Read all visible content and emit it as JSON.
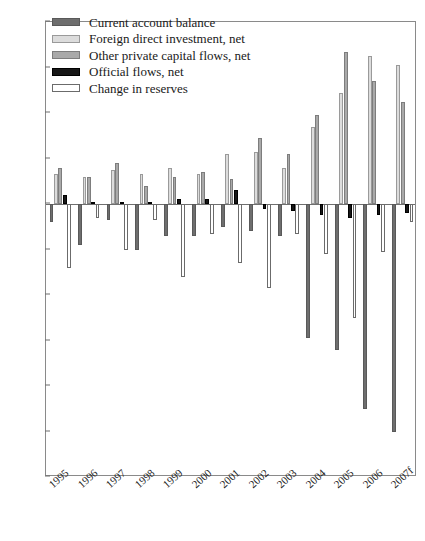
{
  "chart_data": {
    "type": "bar",
    "title": "",
    "subtitle": "",
    "xlabel": "",
    "ylabel": "",
    "ylim": [
      -120,
      80
    ],
    "ytick_step": 20,
    "yticks": [
      80,
      60,
      40,
      20,
      0,
      -20,
      -40,
      -60,
      -80,
      -100,
      -120
    ],
    "grid": false,
    "legend_position": "top-left",
    "categories": [
      "1995",
      "1996",
      "1997",
      "1998",
      "1999",
      "2000",
      "2001",
      "2002",
      "2003",
      "2004",
      "2005",
      "2006",
      "2007f"
    ],
    "series": [
      {
        "name": "Current account balance",
        "color": "#6e6e6e",
        "values": [
          -8,
          -18,
          -7,
          -20,
          -14,
          -14,
          -10,
          -12,
          -14,
          -59,
          -64,
          -90,
          -100
        ]
      },
      {
        "name": "Foreign direct investment, net",
        "color": "#dcdcdc",
        "values": [
          13,
          12,
          15,
          13,
          16,
          13,
          22,
          23,
          16,
          34,
          49,
          65,
          61
        ]
      },
      {
        "name": "Other private capital flows, net",
        "color": "#a9a9a9",
        "values": [
          16,
          12,
          18,
          8,
          12,
          14,
          11,
          29,
          22,
          39,
          67,
          54,
          45
        ]
      },
      {
        "name": "Official flows, net",
        "color": "#171717",
        "values": [
          4,
          1,
          1,
          1,
          2,
          2,
          6,
          -2,
          -3,
          -5,
          -6,
          -5,
          -4
        ]
      },
      {
        "name": "Change in reserves",
        "color": "#ffffff",
        "values": [
          -28,
          -6,
          -20,
          -7,
          -32,
          -13,
          -26,
          -37,
          -13,
          -22,
          -50,
          -21,
          -8
        ]
      }
    ]
  },
  "axis": {
    "y_unit": "",
    "x_note": ""
  }
}
